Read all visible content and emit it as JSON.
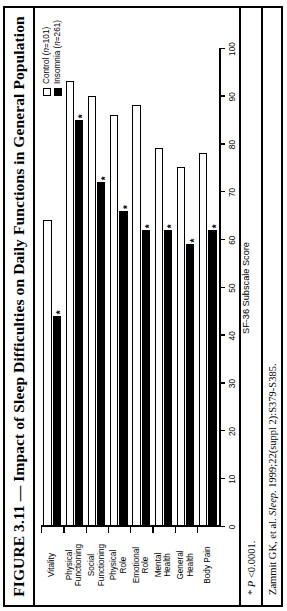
{
  "figure": {
    "title": "FIGURE 3.11 — Impact of Sleep Difficulties on Daily Functions in General Population",
    "significance_note_marker": "*",
    "significance_note": "* P <0.0001.",
    "citation": "Zammit GK, et al. Sleep. 1999;22(suppl 2):S379-S385.",
    "citation_author": "Zammit GK, et al. ",
    "citation_journal": "Sleep",
    "citation_rest": ". 1999;22(suppl 2):S379-S385."
  },
  "legend": {
    "items": [
      {
        "label": "Control (n=101)",
        "label_plain": "Control (",
        "label_italic": "n",
        "label_tail": "=101)",
        "swatch": "open-square-swatch",
        "color": "#ffffff"
      },
      {
        "label": "Insomnia (n=261)",
        "label_plain": "Insomnia (",
        "label_italic": "n",
        "label_tail": "=261)",
        "swatch": "filled-square-swatch",
        "color": "#000000"
      }
    ]
  },
  "chart_data": {
    "type": "bar",
    "orientation": "horizontal",
    "title": "Impact of Sleep Difficulties on Daily Functions in General Population",
    "xlabel": "SF-36 Subscale Score",
    "ylabel": "",
    "xlim": [
      0,
      100
    ],
    "xticks": [
      0,
      10,
      20,
      30,
      40,
      50,
      60,
      70,
      80,
      90,
      100
    ],
    "xtick_labels": [
      "0",
      "10",
      "20",
      "30",
      "40",
      "50",
      "60",
      "70",
      "80",
      "90",
      "100"
    ],
    "grid": false,
    "legend_position": "top-right",
    "categories": [
      "Body Pain",
      "General Health",
      "Mental Health",
      "Emotional Role",
      "Physical Role",
      "Social Functioning",
      "Physical Functioning",
      "Vitality"
    ],
    "category_lines": [
      [
        "Body Pain"
      ],
      [
        "General",
        "Health"
      ],
      [
        "Mental",
        "Health"
      ],
      [
        "Emotional",
        "Role"
      ],
      [
        "Physical",
        "Role"
      ],
      [
        "Social",
        "Functioning"
      ],
      [
        "Physical",
        "Functioning"
      ],
      [
        "Vitality"
      ]
    ],
    "series": [
      {
        "name": "Control (n=101)",
        "color": "#ffffff",
        "values": [
          78,
          75,
          79,
          88,
          86,
          90,
          93,
          64
        ]
      },
      {
        "name": "Insomnia (n=261)",
        "color": "#000000",
        "values": [
          62,
          59,
          62,
          62,
          66,
          72,
          85,
          44
        ]
      }
    ],
    "significance_markers": {
      "series": "Insomnia (n=261)",
      "marker": "*",
      "categories": [
        "Body Pain",
        "General Health",
        "Mental Health",
        "Emotional Role",
        "Physical Role",
        "Social Functioning",
        "Physical Functioning",
        "Vitality"
      ]
    }
  }
}
